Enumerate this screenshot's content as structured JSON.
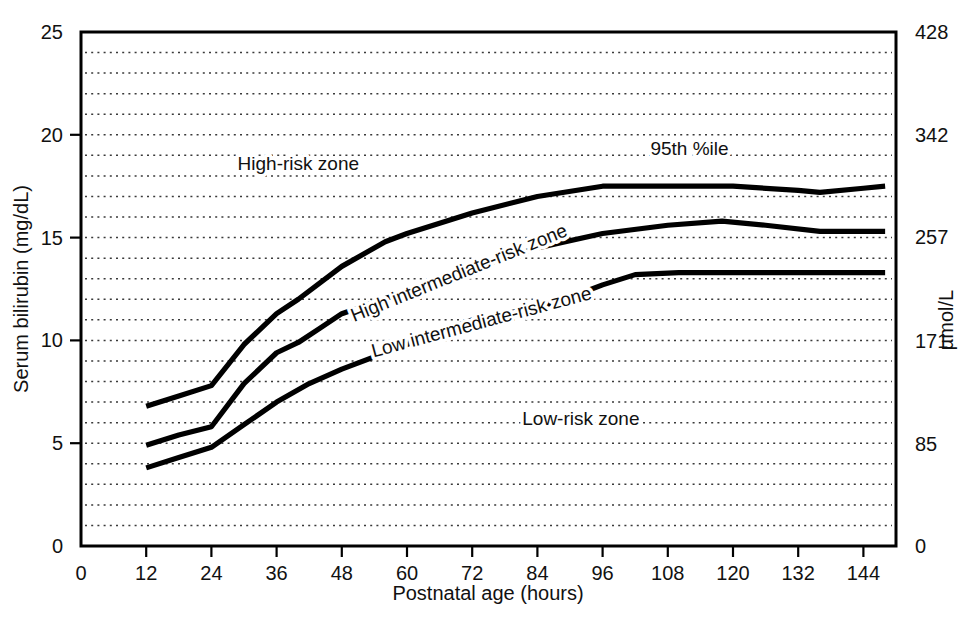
{
  "chart_data": {
    "type": "line",
    "title": "",
    "xlabel": "Postnatal age (hours)",
    "ylabel": "Serum bilirubin (mg/dL)",
    "y2label": "µmol/L",
    "xlim": [
      0,
      150
    ],
    "ylim": [
      0,
      25
    ],
    "y2lim": [
      0,
      428
    ],
    "grid": true,
    "grid_style": "dotted-horizontal-every-1-mg-dL",
    "legend_position": "inline-annotations",
    "xticks": [
      0,
      12,
      24,
      36,
      48,
      60,
      72,
      84,
      96,
      108,
      120,
      132,
      144
    ],
    "xtick_labels": [
      "0",
      "12",
      "24",
      "36",
      "48",
      "60",
      "72",
      "84",
      "96",
      "108",
      "120",
      "132",
      "144"
    ],
    "yticks": [
      0,
      5,
      10,
      15,
      20,
      25
    ],
    "ytick_labels": [
      "0",
      "5",
      "10",
      "15",
      "20",
      "25"
    ],
    "y2ticks": [
      0,
      85,
      171,
      257,
      342,
      428
    ],
    "y2tick_labels": [
      "0",
      "85",
      "171",
      "257",
      "342",
      "428"
    ],
    "annotations": [
      {
        "id": "high-risk",
        "text": "High-risk zone",
        "x": 40,
        "y": 18.3,
        "rotation": 0
      },
      {
        "id": "percentile",
        "text": "95th %ile",
        "x": 112,
        "y": 19.0,
        "rotation": 0
      },
      {
        "id": "high-intermediate-risk",
        "text": "High intermediate-risk zone",
        "x": 70,
        "y": 13.0,
        "rotation": -22
      },
      {
        "id": "low-intermediate-risk",
        "text": "Low intermediate-risk zone",
        "x": 74,
        "y": 10.6,
        "rotation": -15
      },
      {
        "id": "low-risk",
        "text": "Low-risk zone",
        "x": 92,
        "y": 5.9,
        "rotation": 0
      }
    ],
    "series": [
      {
        "name": "95th percentile (high-risk threshold)",
        "color": "#000000",
        "points": [
          [
            12,
            6.8
          ],
          [
            18,
            7.3
          ],
          [
            24,
            7.8
          ],
          [
            30,
            9.8
          ],
          [
            36,
            11.3
          ],
          [
            40,
            12.0
          ],
          [
            48,
            13.6
          ],
          [
            56,
            14.8
          ],
          [
            60,
            15.2
          ],
          [
            72,
            16.2
          ],
          [
            84,
            17.0
          ],
          [
            96,
            17.5
          ],
          [
            108,
            17.5
          ],
          [
            120,
            17.5
          ],
          [
            132,
            17.3
          ],
          [
            136,
            17.2
          ],
          [
            144,
            17.4
          ],
          [
            148,
            17.5
          ]
        ]
      },
      {
        "name": "75th percentile (high intermediate-risk threshold)",
        "color": "#000000",
        "points": [
          [
            12,
            4.9
          ],
          [
            18,
            5.4
          ],
          [
            24,
            5.8
          ],
          [
            30,
            7.9
          ],
          [
            36,
            9.4
          ],
          [
            40,
            9.9
          ],
          [
            44,
            10.6
          ],
          [
            48,
            11.3
          ],
          [
            60,
            12.4
          ],
          [
            72,
            13.5
          ],
          [
            84,
            14.5
          ],
          [
            96,
            15.2
          ],
          [
            108,
            15.6
          ],
          [
            118,
            15.8
          ],
          [
            126,
            15.6
          ],
          [
            136,
            15.3
          ],
          [
            144,
            15.3
          ],
          [
            148,
            15.3
          ]
        ]
      },
      {
        "name": "40th percentile (low intermediate-risk threshold)",
        "color": "#000000",
        "points": [
          [
            12,
            3.8
          ],
          [
            18,
            4.3
          ],
          [
            24,
            4.8
          ],
          [
            30,
            5.9
          ],
          [
            36,
            7.0
          ],
          [
            42,
            7.9
          ],
          [
            48,
            8.6
          ],
          [
            60,
            9.8
          ],
          [
            72,
            11.0
          ],
          [
            84,
            11.6
          ],
          [
            90,
            12.1
          ],
          [
            96,
            12.7
          ],
          [
            102,
            13.2
          ],
          [
            110,
            13.3
          ],
          [
            120,
            13.3
          ],
          [
            132,
            13.3
          ],
          [
            144,
            13.3
          ],
          [
            148,
            13.3
          ]
        ]
      }
    ]
  },
  "figure": {
    "background": "#ffffff",
    "line_color": "#000000",
    "grid_color": "#3a3a3a"
  }
}
